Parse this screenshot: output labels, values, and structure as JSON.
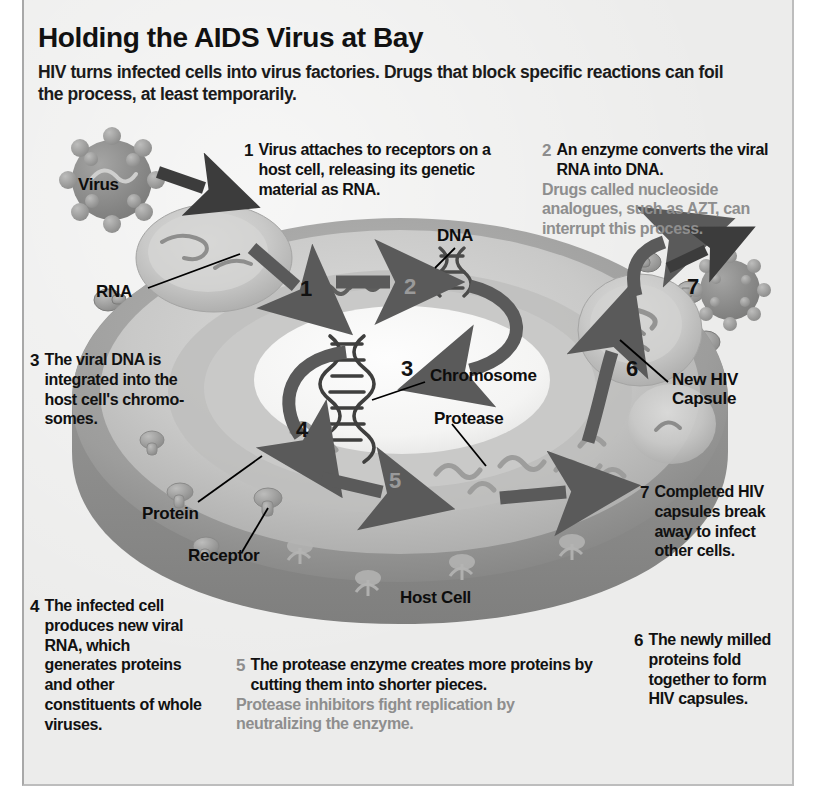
{
  "header": {
    "title": "Holding the AIDS Virus at Bay",
    "subtitle": "HIV turns infected cells into virus factories. Drugs that block specific reactions can foil the process, at least temporarily."
  },
  "steps": [
    {
      "number": "1",
      "number_style": "black",
      "text": "Virus attaches to receptors on a host cell, releasing its genetic material as RNA.",
      "note": ""
    },
    {
      "number": "2",
      "number_style": "gray",
      "text": "An enzyme converts the viral RNA into DNA.",
      "note": "Drugs called nucleoside analogues, such as AZT, can interrupt this process."
    },
    {
      "number": "3",
      "number_style": "black",
      "text": "The viral DNA is integrated into the host cell's chromo­somes.",
      "note": ""
    },
    {
      "number": "4",
      "number_style": "black",
      "text": "The infected cell produces new viral RNA, which generates proteins and other constituents of whole viruses.",
      "note": ""
    },
    {
      "number": "5",
      "number_style": "gray",
      "text": "The protease enzyme creates more proteins by cutting them into shorter pieces.",
      "note": "Protease inhibitors fight replication by neutralizing the enzyme."
    },
    {
      "number": "6",
      "number_style": "black",
      "text": "The newly milled proteins fold together to form HIV capsules.",
      "note": ""
    },
    {
      "number": "7",
      "number_style": "black",
      "text": "Completed HIV capsules break away to infect other cells.",
      "note": ""
    }
  ],
  "labels": {
    "virus": "Virus",
    "rna": "RNA",
    "dna": "DNA",
    "chromosome": "Chromosome",
    "protease": "Protease",
    "protein": "Protein",
    "receptor": "Receptor",
    "host_cell": "Host Cell",
    "new_hiv_capsule": "New HIV\nCapsule"
  },
  "diagram_numerals": {
    "n1": "1",
    "n2": "2",
    "n3": "3",
    "n4": "4",
    "n5": "5",
    "n6": "6",
    "n7": "7"
  },
  "colors": {
    "background": "#ececeb",
    "cell_membrane": "#9a9a9a",
    "cytoplasm": "#c3c3c3",
    "cytoplasm_light": "#d2d2d1",
    "nucleus": "#f7f7f6",
    "cell_shadow": "#8a8a8a",
    "arrow": "#5a5a5a",
    "text": "#111111",
    "note_text": "#8e8e8e",
    "virus_particle": "#8f8f8f"
  }
}
